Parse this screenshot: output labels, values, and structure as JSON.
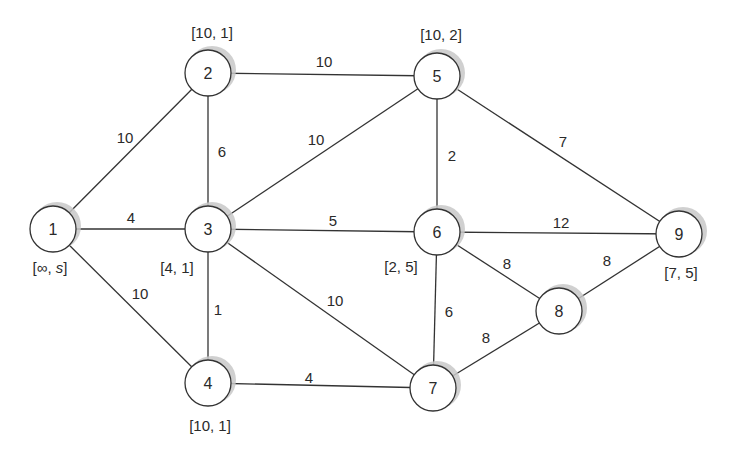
{
  "diagram": {
    "type": "weighted-undirected-graph",
    "node_radius": 23,
    "colors": {
      "stroke": "#333333",
      "fill": "#ffffff",
      "shadow": "#c8c8c8",
      "text": "#2a2a2a"
    },
    "nodes": [
      {
        "id": "1",
        "x": 53,
        "y": 229,
        "label": "[∞, s]",
        "label_x": 50,
        "label_y": 267
      },
      {
        "id": "2",
        "x": 208,
        "y": 73,
        "label": "[10, 1]",
        "label_x": 212,
        "label_y": 32
      },
      {
        "id": "3",
        "x": 208,
        "y": 229,
        "label": "[4, 1]",
        "label_x": 177,
        "label_y": 267
      },
      {
        "id": "4",
        "x": 208,
        "y": 383,
        "label": "[10, 1]",
        "label_x": 210,
        "label_y": 425
      },
      {
        "id": "5",
        "x": 437,
        "y": 76,
        "label": "[10, 2]",
        "label_x": 441,
        "label_y": 34
      },
      {
        "id": "6",
        "x": 437,
        "y": 232,
        "label": "[2, 5]",
        "label_x": 401,
        "label_y": 266
      },
      {
        "id": "7",
        "x": 433,
        "y": 388,
        "label": null,
        "label_x": null,
        "label_y": null
      },
      {
        "id": "8",
        "x": 559,
        "y": 311,
        "label": null,
        "label_x": null,
        "label_y": null
      },
      {
        "id": "9",
        "x": 679,
        "y": 234,
        "label": "[7, 5]",
        "label_x": 681,
        "label_y": 272
      }
    ],
    "edges": [
      {
        "from": "1",
        "to": "2",
        "weight": "10",
        "wx": 125,
        "wy": 137
      },
      {
        "from": "1",
        "to": "3",
        "weight": "4",
        "wx": 131,
        "wy": 217
      },
      {
        "from": "1",
        "to": "4",
        "weight": "10",
        "wx": 140,
        "wy": 293
      },
      {
        "from": "2",
        "to": "5",
        "weight": "10",
        "wx": 324,
        "wy": 61
      },
      {
        "from": "2",
        "to": "3",
        "weight": "6",
        "wx": 222,
        "wy": 151
      },
      {
        "from": "3",
        "to": "5",
        "weight": "10",
        "wx": 316,
        "wy": 139
      },
      {
        "from": "3",
        "to": "6",
        "weight": "5",
        "wx": 333,
        "wy": 220
      },
      {
        "from": "3",
        "to": "4",
        "weight": "1",
        "wx": 218,
        "wy": 309
      },
      {
        "from": "3",
        "to": "7",
        "weight": "10",
        "wx": 335,
        "wy": 300
      },
      {
        "from": "4",
        "to": "7",
        "weight": "4",
        "wx": 309,
        "wy": 377
      },
      {
        "from": "5",
        "to": "6",
        "weight": "2",
        "wx": 452,
        "wy": 155
      },
      {
        "from": "5",
        "to": "9",
        "weight": "7",
        "wx": 563,
        "wy": 141
      },
      {
        "from": "6",
        "to": "9",
        "weight": "12",
        "wx": 561,
        "wy": 222
      },
      {
        "from": "6",
        "to": "8",
        "weight": "8",
        "wx": 507,
        "wy": 263
      },
      {
        "from": "6",
        "to": "7",
        "weight": "6",
        "wx": 449,
        "wy": 311
      },
      {
        "from": "7",
        "to": "8",
        "weight": "8",
        "wx": 486,
        "wy": 337
      },
      {
        "from": "8",
        "to": "9",
        "weight": "8",
        "wx": 607,
        "wy": 260
      }
    ]
  }
}
